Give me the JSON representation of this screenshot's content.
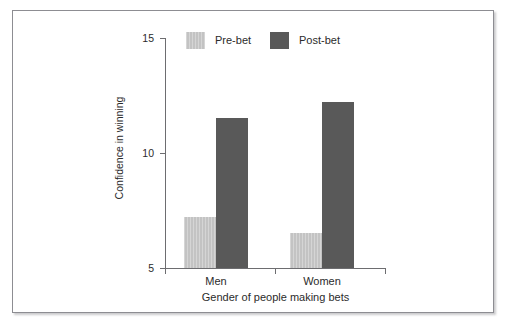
{
  "chart_data": {
    "type": "bar",
    "title": "",
    "subtitle": "",
    "xlabel": "Gender of people making bets",
    "ylabel": "Confidence in winning",
    "categories": [
      "Men",
      "Women"
    ],
    "series": [
      {
        "name": "Pre-bet",
        "color": "#c3c3c3",
        "values": [
          7.2,
          6.5
        ]
      },
      {
        "name": "Post-bet",
        "color": "#595959",
        "values": [
          11.5,
          12.2
        ]
      }
    ],
    "ylim": [
      5,
      15
    ],
    "yticks": [
      5,
      10,
      15
    ],
    "ytick_labels": [
      "5",
      "10",
      "15"
    ],
    "xtick_labels": [
      "Men",
      "Women"
    ],
    "grid": false,
    "legend_position": "top-center",
    "axis_color": "#6d6d70",
    "text_color": "#2b2b2b",
    "background": "#ffffff"
  },
  "axis": {
    "y_tick_top": "15",
    "y_tick_mid": "10",
    "y_tick_bottom": "5",
    "y_title": "Confidence in winning",
    "x_title": "Gender of people making bets",
    "x_tick_left": "Men",
    "x_tick_right": "Women"
  },
  "legend": {
    "items": [
      {
        "label": "Pre-bet"
      },
      {
        "label": "Post-bet"
      }
    ]
  }
}
